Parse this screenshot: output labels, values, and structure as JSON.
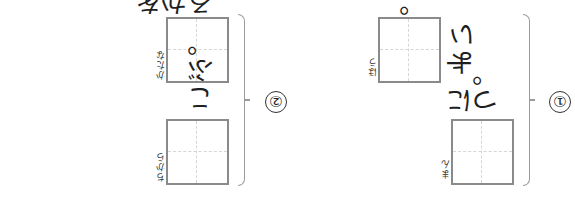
{
  "worksheet": {
    "orientation": "rotated-180",
    "questions": [
      {
        "number": "1",
        "number_glyph": "①",
        "items": [
          {
            "before": "よい",
            "ruby": "ほう",
            "after": "。"
          },
          {
            "before": "",
            "ruby": "まん",
            "after": "に 一つ。"
          }
        ]
      },
      {
        "number": "2",
        "number_glyph": "②",
        "items": [
          {
            "before": "",
            "ruby": "かたな",
            "after": "を かざる。"
          },
          {
            "before": "",
            "ruby": "ちから",
            "after": "こぶ。"
          }
        ]
      }
    ]
  },
  "colors": {
    "box_border": "#8a8a8a",
    "guide_line": "#d6d6d6",
    "text": "#1f1f1f",
    "brace": "#9a9a9a"
  }
}
